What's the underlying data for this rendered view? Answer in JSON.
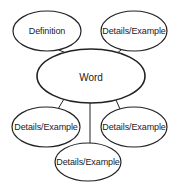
{
  "diagram": {
    "type": "concept-map",
    "center": {
      "label": "Word",
      "cx": 91,
      "cy": 76,
      "rx": 54,
      "ry": 27
    },
    "nodes": [
      {
        "id": "definition",
        "label": "Definition",
        "cx": 47,
        "cy": 31,
        "rx": 34,
        "ry": 20
      },
      {
        "id": "details-top-right",
        "label": "Details/Example",
        "cx": 134,
        "cy": 31,
        "rx": 33,
        "ry": 20
      },
      {
        "id": "details-bottom-left",
        "label": "Details/Example",
        "cx": 46,
        "cy": 127,
        "rx": 34,
        "ry": 20
      },
      {
        "id": "details-bottom-right",
        "label": "Details/Example",
        "cx": 134,
        "cy": 127,
        "rx": 33,
        "ry": 20
      },
      {
        "id": "details-bottom-center",
        "label": "Details/Example",
        "cx": 88,
        "cy": 162,
        "rx": 33,
        "ry": 19
      }
    ],
    "stroke_color": "#222222"
  }
}
